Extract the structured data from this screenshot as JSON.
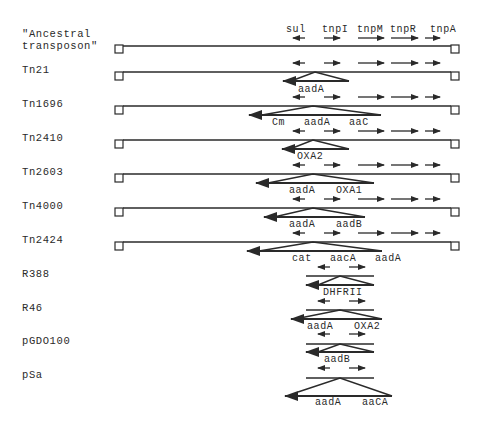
{
  "figure": {
    "type": "transposon-gene-organization-diagram",
    "header_genes": [
      "sul",
      "tnpI",
      "tnpM",
      "tnpR",
      "tnpA"
    ],
    "colors": {
      "ink": "#2a2a2a",
      "background": "#ffffff"
    }
  },
  "rows": [
    {
      "name": "\"Ancestral",
      "name2": "transposon\"",
      "kind": "transposon",
      "cassettes": []
    },
    {
      "name": "Tn21",
      "kind": "transposon",
      "cassettes": [
        "aadA"
      ]
    },
    {
      "name": "Tn1696",
      "kind": "transposon",
      "cassettes": [
        "Cm",
        "aadA",
        "aaC"
      ]
    },
    {
      "name": "Tn2410",
      "kind": "transposon",
      "cassettes": [
        "OXA2"
      ]
    },
    {
      "name": "Tn2603",
      "kind": "transposon",
      "cassettes": [
        "aadA",
        "OXA1"
      ]
    },
    {
      "name": "Tn4000",
      "kind": "transposon",
      "cassettes": [
        "aadA",
        "aadB"
      ]
    },
    {
      "name": "Tn2424",
      "kind": "transposon",
      "cassettes": [
        "cat",
        "aacA",
        "aadA"
      ]
    },
    {
      "name": "R388",
      "kind": "plasmid",
      "cassettes": [
        "DHFRII"
      ]
    },
    {
      "name": "R46",
      "kind": "plasmid",
      "cassettes": [
        "aadA",
        "OXA2"
      ]
    },
    {
      "name": "pGDO100",
      "kind": "plasmid",
      "cassettes": [
        "aadB"
      ]
    },
    {
      "name": "pSa",
      "kind": "plasmid",
      "cassettes": [
        "aadA",
        "aaCA"
      ]
    }
  ]
}
